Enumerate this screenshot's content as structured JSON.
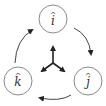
{
  "diagram": {
    "nodes": [
      {
        "id": "i",
        "label": "i",
        "hat": "^",
        "cx": 53,
        "cy": 19
      },
      {
        "id": "j",
        "label": "j",
        "hat": "^",
        "cx": 88,
        "cy": 81
      },
      {
        "id": "k",
        "label": "k",
        "hat": "^",
        "cx": 18,
        "cy": 81
      }
    ],
    "cycle_arrows": [
      {
        "from": "k",
        "to": "i",
        "direction": "clockwise"
      },
      {
        "from": "i",
        "to": "j",
        "direction": "clockwise"
      },
      {
        "from": "j",
        "to": "k",
        "direction": "clockwise"
      }
    ],
    "center_axes": [
      "up",
      "down-left",
      "down-right"
    ],
    "colors": {
      "stroke": "#333333",
      "circle": "#888888",
      "background": "#ffffff"
    }
  }
}
